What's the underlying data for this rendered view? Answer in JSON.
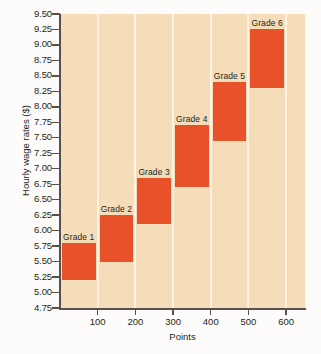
{
  "chart_data": {
    "type": "bar",
    "title": "",
    "subtitle": "",
    "xlabel": "Points",
    "ylabel": "Hourly wage rates ($)",
    "xlim": [
      0,
      650
    ],
    "ylim": [
      4.75,
      9.5
    ],
    "grid": "vertical",
    "legend": "none",
    "bar_color": "#e8522a",
    "plot_background": "#f6ddba",
    "orientation": "range-bars",
    "y_ticks": [
      "9.50",
      "9.25",
      "9.00",
      "8.75",
      "8.50",
      "8.25",
      "8.00",
      "7.75",
      "7.50",
      "7.25",
      "7.00",
      "6.75",
      "6.50",
      "6.25",
      "6.00",
      "5.75",
      "5.50",
      "5.25",
      "5.00",
      "4.75"
    ],
    "y_tick_values": [
      9.5,
      9.25,
      9.0,
      8.75,
      8.5,
      8.25,
      8.0,
      7.75,
      7.5,
      7.25,
      7.0,
      6.75,
      6.5,
      6.25,
      6.0,
      5.75,
      5.5,
      5.25,
      5.0,
      4.75
    ],
    "x_ticks": [
      "100",
      "200",
      "300",
      "400",
      "500",
      "600"
    ],
    "x_tick_values": [
      100,
      200,
      300,
      400,
      500,
      600
    ],
    "categories": [
      "Grade 1",
      "Grade 2",
      "Grade 3",
      "Grade 4",
      "Grade 5",
      "Grade 6"
    ],
    "bars": [
      {
        "label": "Grade 1",
        "x_start": 0,
        "x_end": 100,
        "y_low": 5.2,
        "y_high": 5.8
      },
      {
        "label": "Grade 2",
        "x_start": 100,
        "x_end": 200,
        "y_low": 5.5,
        "y_high": 6.25
      },
      {
        "label": "Grade 3",
        "x_start": 200,
        "x_end": 300,
        "y_low": 6.1,
        "y_high": 6.85
      },
      {
        "label": "Grade 4",
        "x_start": 300,
        "x_end": 400,
        "y_low": 6.7,
        "y_high": 7.7
      },
      {
        "label": "Grade 5",
        "x_start": 400,
        "x_end": 500,
        "y_low": 7.45,
        "y_high": 8.4
      },
      {
        "label": "Grade 6",
        "x_start": 500,
        "x_end": 600,
        "y_low": 8.3,
        "y_high": 9.25
      }
    ]
  }
}
